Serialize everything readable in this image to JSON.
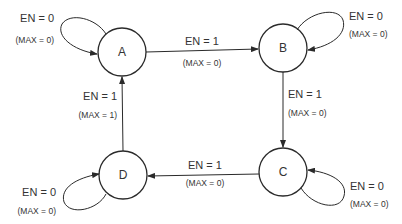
{
  "diagram": {
    "type": "state-machine",
    "colors": {
      "stroke": "#2a2a2a",
      "text": "#333333",
      "background": "#ffffff"
    },
    "states": [
      {
        "id": "A",
        "label": "A",
        "cx": 122,
        "cy": 52
      },
      {
        "id": "B",
        "label": "B",
        "cx": 283,
        "cy": 48
      },
      {
        "id": "C",
        "label": "C",
        "cx": 283,
        "cy": 172
      },
      {
        "id": "D",
        "label": "D",
        "cx": 123,
        "cy": 175
      }
    ],
    "transitions": [
      {
        "from": "A",
        "to": "A",
        "condition": "EN = 0",
        "output": "(MAX = 0)"
      },
      {
        "from": "A",
        "to": "B",
        "condition": "EN = 1",
        "output": "(MAX = 0)"
      },
      {
        "from": "B",
        "to": "B",
        "condition": "EN = 0",
        "output": "(MAX = 0)"
      },
      {
        "from": "B",
        "to": "C",
        "condition": "EN = 1",
        "output": "(MAX = 0)"
      },
      {
        "from": "C",
        "to": "C",
        "condition": "EN = 0",
        "output": "(MAX = 0)"
      },
      {
        "from": "C",
        "to": "D",
        "condition": "EN = 1",
        "output": "(MAX = 0)"
      },
      {
        "from": "D",
        "to": "D",
        "condition": "EN = 0",
        "output": "(MAX = 0)"
      },
      {
        "from": "D",
        "to": "A",
        "condition": "EN = 1",
        "output": "(MAX = 1)"
      }
    ]
  }
}
